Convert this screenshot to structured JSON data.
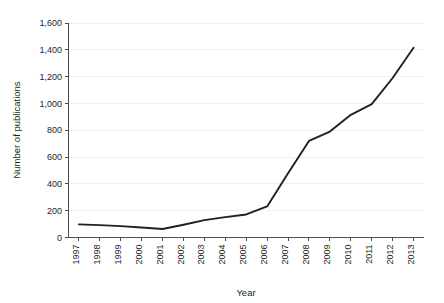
{
  "chart_data": {
    "type": "line",
    "title": "",
    "xlabel": "Year",
    "ylabel": "Number of publications",
    "categories": [
      "1997",
      "1998",
      "1999",
      "2000",
      "2001",
      "2002",
      "2003",
      "2004",
      "2005",
      "2006",
      "2007",
      "2008",
      "2009",
      "2010",
      "2011",
      "2012",
      "2013"
    ],
    "values": [
      98,
      92,
      85,
      75,
      63,
      95,
      130,
      152,
      172,
      232,
      480,
      720,
      790,
      915,
      995,
      1190,
      1415
    ],
    "series": [
      {
        "name": "Number of publications",
        "values": [
          98,
          92,
          85,
          75,
          63,
          95,
          130,
          152,
          172,
          232,
          480,
          720,
          790,
          915,
          995,
          1190,
          1415
        ]
      }
    ],
    "ylim": [
      0,
      1600
    ],
    "ytick_values": [
      0,
      200,
      400,
      600,
      800,
      1000,
      1200,
      1400,
      1600
    ],
    "ytick_labels": [
      "0",
      "200",
      "400",
      "600",
      "800",
      "1,000",
      "1,200",
      "1,400",
      "1,600"
    ],
    "xtick_labels": [
      "1997",
      "1998",
      "1999",
      "2000",
      "2001",
      "2002",
      "2003",
      "2004",
      "2005",
      "2006",
      "2007",
      "2008",
      "2009",
      "2010",
      "2011",
      "2012",
      "2013"
    ],
    "grid": "horizontal",
    "legend": "none",
    "line_color": "#231f20",
    "grid_color": "#ececec",
    "axis_color": "#4d4d4d",
    "background_color": "#ffffff",
    "xtick_label_rotation": -90
  }
}
